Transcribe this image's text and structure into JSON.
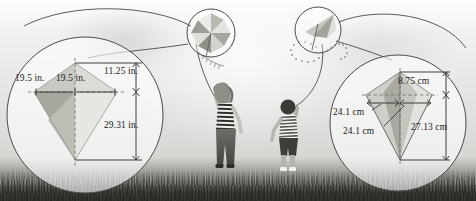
{
  "figure": {
    "type": "illustration-with-callouts",
    "scene": {
      "people": [
        {
          "name": "girl-flying-kite",
          "clothing": "striped-shirt"
        },
        {
          "name": "boy-flying-kite",
          "clothing": "striped-shirt"
        }
      ],
      "kites": [
        {
          "name": "pinwheel-kite",
          "shape": "diamond-pinwheel"
        },
        {
          "name": "delta-kite",
          "shape": "delta-with-tail"
        }
      ],
      "ground_label": "grass-field"
    },
    "callouts": [
      {
        "id": "left-callout",
        "name": "inches-kite-callout",
        "unit": "in.",
        "shape": "diamond-kite",
        "measurements": [
          {
            "name": "half-width-left",
            "value": "19.5 in."
          },
          {
            "name": "half-width-right",
            "value": "19.5 in."
          },
          {
            "name": "upper-height",
            "value": "11.25 in."
          },
          {
            "name": "lower-height",
            "value": "29.31 in."
          }
        ]
      },
      {
        "id": "right-callout",
        "name": "centimeters-kite-callout",
        "unit": "cm",
        "shape": "delta-kite",
        "measurements": [
          {
            "name": "upper-height",
            "value": "8.75 cm"
          },
          {
            "name": "half-width-left",
            "value": "24.1 cm"
          },
          {
            "name": "half-width-right",
            "value": "24.1 cm"
          },
          {
            "name": "lower-height",
            "value": "27.13 cm"
          }
        ]
      }
    ],
    "colors": {
      "line": "#2a2a2a",
      "dashed": "#707070",
      "kite_light": "#dcdcd8",
      "kite_mid": "#bcbcb6",
      "kite_dark": "#9a9a93",
      "text": "#1b1b1b"
    }
  }
}
